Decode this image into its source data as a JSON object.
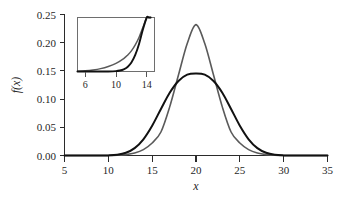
{
  "chart_data": {
    "type": "line",
    "title": "",
    "subtitle": "",
    "xlabel": "x",
    "ylabel": "f(x)",
    "xlim": [
      5,
      35
    ],
    "ylim": [
      0.0,
      0.25
    ],
    "grid": false,
    "legend_position": "none",
    "x_ticks": [
      5,
      10,
      15,
      20,
      25,
      30,
      35
    ],
    "x_tick_labels": [
      "5",
      "10",
      "15",
      "20",
      "25",
      "30",
      "35"
    ],
    "y_ticks": [
      0.0,
      0.05,
      0.1,
      0.15,
      0.2,
      0.25
    ],
    "y_tick_labels": [
      "0.00",
      "0.05",
      "0.10",
      "0.15",
      "0.20",
      "0.25"
    ],
    "series": [
      {
        "name": "narrow-peaked-density",
        "color": "#5a5a5a",
        "linewidth": 1.6,
        "peak_x": 20,
        "peak_y": 0.232,
        "x": [
          5,
          6,
          7,
          8,
          9,
          10,
          11,
          12,
          13,
          14,
          15,
          16,
          17,
          18,
          19,
          20,
          21,
          22,
          23,
          24,
          25,
          26,
          27,
          28,
          29,
          30,
          31,
          32,
          33,
          34,
          35
        ],
        "values": [
          0.0,
          0.0,
          0.0,
          0.0,
          0.0,
          0.0,
          0.0005,
          0.0016,
          0.0044,
          0.0105,
          0.0222,
          0.0417,
          0.0862,
          0.1426,
          0.1985,
          0.232,
          0.1985,
          0.1426,
          0.0862,
          0.0417,
          0.0222,
          0.0105,
          0.0044,
          0.0016,
          0.0005,
          0.0,
          0.0,
          0.0,
          0.0,
          0.0,
          0.0
        ]
      },
      {
        "name": "broad-heavy-tailed-density",
        "color": "#111111",
        "linewidth": 2.0,
        "peak_x": 20,
        "peak_y": 0.1455,
        "x": [
          5,
          6,
          7,
          8,
          9,
          10,
          11,
          12,
          13,
          14,
          15,
          16,
          17,
          18,
          19,
          20,
          21,
          22,
          23,
          24,
          25,
          26,
          27,
          28,
          29,
          30,
          31,
          32,
          33,
          34,
          35
        ],
        "values": [
          0.0,
          0.0,
          0.0,
          0.0,
          0.0,
          0.0002,
          0.0013,
          0.0048,
          0.0131,
          0.0288,
          0.0528,
          0.0825,
          0.1113,
          0.1322,
          0.1434,
          0.1455,
          0.1434,
          0.1322,
          0.1113,
          0.0825,
          0.0528,
          0.0288,
          0.0131,
          0.0048,
          0.0013,
          0.0002,
          0.0,
          0.0,
          0.0,
          0.0,
          0.0
        ]
      }
    ],
    "inset": {
      "type": "line",
      "xlim": [
        5,
        15
      ],
      "ylim": [
        0.0,
        0.045
      ],
      "x_ticks": [
        6,
        10,
        14
      ],
      "x_tick_labels": [
        "6",
        "10",
        "14"
      ],
      "y_ticks": [],
      "y_tick_labels": [],
      "grid": false,
      "series": [
        {
          "name": "narrow-peaked-density-tail",
          "color": "#5a5a5a",
          "linewidth": 1.5,
          "x": [
            5,
            6,
            7,
            8,
            9,
            10,
            11,
            11.5,
            12,
            12.5,
            13,
            13.5,
            14,
            14.25,
            14.5
          ],
          "values": [
            0.0002,
            0.0006,
            0.0013,
            0.0024,
            0.0042,
            0.0068,
            0.0108,
            0.0136,
            0.0172,
            0.0222,
            0.0286,
            0.0368,
            0.0462,
            0.0492,
            0.0515
          ]
        },
        {
          "name": "broad-heavy-tailed-density-tail",
          "color": "#111111",
          "linewidth": 1.9,
          "x": [
            5,
            6,
            7,
            8,
            9,
            10,
            10.5,
            11,
            11.5,
            12,
            12.5,
            13,
            13.5,
            14,
            14.25,
            14.5
          ],
          "values": [
            0.0,
            0.0,
            0.0,
            0.0,
            5e-05,
            0.0003,
            0.0008,
            0.0018,
            0.0038,
            0.0075,
            0.0138,
            0.0232,
            0.0352,
            0.0478,
            0.0525,
            0.0555
          ]
        }
      ]
    }
  },
  "figure": {
    "background_color": "#ffffff",
    "axis_color": "#2b2b2b",
    "inset_frame_color": "#6e6e6e"
  }
}
